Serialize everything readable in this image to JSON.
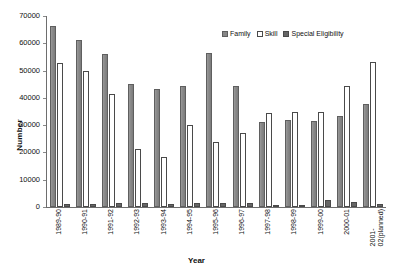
{
  "chart_data": {
    "type": "bar",
    "title": "",
    "xlabel": "Year",
    "ylabel": "Number",
    "ylim": [
      0,
      70000
    ],
    "ytick_step": 10000,
    "yticks": [
      "70000",
      "60000",
      "50000",
      "40000",
      "30000",
      "20000",
      "10000",
      "0"
    ],
    "grid": false,
    "legend_position": "top-right",
    "categories": [
      "1989-90",
      "1990-91",
      "1991-92",
      "1992-93",
      "1993-94",
      "1994-95",
      "1995-96",
      "1996-97",
      "1997-98",
      "1998-99",
      "1999-00",
      "2000-01",
      "2001-02(planned)"
    ],
    "series": [
      {
        "name": "Family",
        "color": "#878787",
        "values": [
          66500,
          61200,
          56000,
          45200,
          43100,
          44200,
          56500,
          44200,
          31100,
          31800,
          31500,
          33200,
          37600
        ]
      },
      {
        "name": "Skill",
        "color": "#ffffff",
        "values": [
          52800,
          50000,
          41400,
          21100,
          18200,
          30200,
          23800,
          27300,
          34300,
          34700,
          35000,
          44200,
          53100
        ]
      },
      {
        "name": "Special Eligibility",
        "color": "#666666",
        "values": [
          1100,
          1200,
          1500,
          1300,
          1200,
          1500,
          1400,
          1500,
          900,
          600,
          2400,
          1900,
          1200
        ]
      }
    ]
  },
  "legend": {
    "items": [
      {
        "label": "Family",
        "swatch": "family-swatch-icon"
      },
      {
        "label": "Skill",
        "swatch": "skill-swatch-icon"
      },
      {
        "label": "Special Eligibility",
        "swatch": "special-eligibility-swatch-icon"
      }
    ]
  },
  "axes": {
    "y_title": "Number",
    "x_title": "Year"
  }
}
